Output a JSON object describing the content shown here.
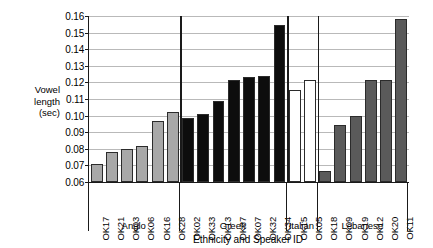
{
  "chart_data": {
    "type": "bar",
    "title": "",
    "xlabel": "Ethnicity and Speaker ID",
    "ylabel": "Vowel length (sec)",
    "ylabel_lines": [
      "Vowel",
      "length",
      "(sec)"
    ],
    "ylim": [
      0.06,
      0.16
    ],
    "ytick_labels": [
      "0.06",
      "0.07",
      "0.08",
      "0.09",
      "0.10",
      "0.11",
      "0.12",
      "0.13",
      "0.14",
      "0.15",
      "0.16"
    ],
    "ytick_values": [
      0.06,
      0.07,
      0.08,
      0.09,
      0.1,
      0.11,
      0.12,
      0.13,
      0.14,
      0.15,
      0.16
    ],
    "grid": true,
    "legend_position": "none",
    "categories": [
      "OK17",
      "OK21",
      "OK03",
      "OK06",
      "OK16",
      "OK28",
      "OK02",
      "OK33",
      "OK13",
      "OK37",
      "OK07",
      "OK32",
      "OK34",
      "OK15",
      "OK05",
      "OK18",
      "OK09",
      "OK19",
      "OK12",
      "OK20",
      "OK11"
    ],
    "values": [
      0.071,
      0.078,
      0.08,
      0.0815,
      0.0965,
      0.102,
      0.0985,
      0.101,
      0.109,
      0.1215,
      0.123,
      0.124,
      0.1545,
      0.1155,
      0.1215,
      0.0665,
      0.0945,
      0.0995,
      0.1215,
      0.1215,
      0.158
    ],
    "groups": [
      {
        "name": "Anglo",
        "start": 0,
        "count": 6,
        "color": "#a8a8a8"
      },
      {
        "name": "Greek",
        "start": 6,
        "count": 7,
        "color": "#0d0d0d"
      },
      {
        "name": "Italian",
        "start": 13,
        "count": 2,
        "color": "#ffffff"
      },
      {
        "name": "Lebanese",
        "start": 15,
        "count": 6,
        "color": "#5a5a5a"
      }
    ],
    "bars": [
      {
        "label": "OK17",
        "value": 0.071,
        "group": "Anglo",
        "color": "#a8a8a8"
      },
      {
        "label": "OK21",
        "value": 0.078,
        "group": "Anglo",
        "color": "#a8a8a8"
      },
      {
        "label": "OK03",
        "value": 0.08,
        "group": "Anglo",
        "color": "#a8a8a8"
      },
      {
        "label": "OK06",
        "value": 0.0815,
        "group": "Anglo",
        "color": "#a8a8a8"
      },
      {
        "label": "OK16",
        "value": 0.0965,
        "group": "Anglo",
        "color": "#a8a8a8"
      },
      {
        "label": "OK28",
        "value": 0.102,
        "group": "Anglo",
        "color": "#a8a8a8"
      },
      {
        "label": "OK02",
        "value": 0.0985,
        "group": "Greek",
        "color": "#0d0d0d"
      },
      {
        "label": "OK33",
        "value": 0.101,
        "group": "Greek",
        "color": "#0d0d0d"
      },
      {
        "label": "OK13",
        "value": 0.109,
        "group": "Greek",
        "color": "#0d0d0d"
      },
      {
        "label": "OK37",
        "value": 0.1215,
        "group": "Greek",
        "color": "#0d0d0d"
      },
      {
        "label": "OK07",
        "value": 0.123,
        "group": "Greek",
        "color": "#0d0d0d"
      },
      {
        "label": "OK32",
        "value": 0.124,
        "group": "Greek",
        "color": "#0d0d0d"
      },
      {
        "label": "OK34",
        "value": 0.1545,
        "group": "Greek",
        "color": "#0d0d0d"
      },
      {
        "label": "OK15",
        "value": 0.1155,
        "group": "Italian",
        "color": "#ffffff"
      },
      {
        "label": "OK05",
        "value": 0.1215,
        "group": "Italian",
        "color": "#ffffff"
      },
      {
        "label": "OK18",
        "value": 0.0665,
        "group": "Lebanese",
        "color": "#5a5a5a"
      },
      {
        "label": "OK09",
        "value": 0.0945,
        "group": "Lebanese",
        "color": "#5a5a5a"
      },
      {
        "label": "OK19",
        "value": 0.0995,
        "group": "Lebanese",
        "color": "#5a5a5a"
      },
      {
        "label": "OK12",
        "value": 0.1215,
        "group": "Lebanese",
        "color": "#5a5a5a"
      },
      {
        "label": "OK20",
        "value": 0.1215,
        "group": "Lebanese",
        "color": "#5a5a5a"
      },
      {
        "label": "OK11",
        "value": 0.158,
        "group": "Lebanese",
        "color": "#5a5a5a"
      }
    ]
  }
}
